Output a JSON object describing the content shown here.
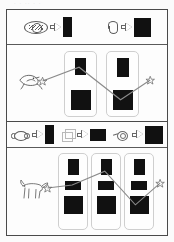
{
  "figure": {
    "scan_ghost_text": "· ·  ·· ·   ·",
    "panels": [
      {
        "id": "panel-a",
        "tag": "a",
        "legend": {
          "items": [
            {
              "source_icon": "plate-noodles-sketch-icon",
              "arrow_icon": "right-arrow-icon",
              "target_icon": "black-tall-rect",
              "target_w": 9,
              "target_h": 20
            },
            {
              "source_icon": "curved-worm-sketch-icon",
              "arrow_icon": "right-arrow-icon",
              "target_icon": "black-square",
              "target_w": 17,
              "target_h": 19
            }
          ]
        },
        "plot": {
          "animal_icon": "bird-sketch-icon",
          "start_marker": "star-marker",
          "end_marker": "star-marker",
          "cards": [
            {
              "boxes": [
                {
                  "w": 11,
                  "h": 17
                },
                {
                  "w": 20,
                  "h": 20
                }
              ]
            },
            {
              "boxes": [
                {
                  "w": 12,
                  "h": 19
                },
                {
                  "w": 20,
                  "h": 20
                }
              ]
            }
          ]
        }
      },
      {
        "id": "panel-b",
        "tag": "b",
        "legend": {
          "items": [
            {
              "source_icon": "peanut-oval-sketch-icon",
              "arrow_icon": "right-arrow-icon",
              "target_icon": "black-tall-rect",
              "target_w": 9,
              "target_h": 19
            },
            {
              "source_icon": "cube-outline-sketch-icon",
              "arrow_icon": "right-arrow-icon",
              "target_icon": "black-wide-rect",
              "target_w": 16,
              "target_h": 12
            },
            {
              "source_icon": "ring-tail-sketch-icon",
              "arrow_icon": "right-arrow-icon",
              "target_icon": "black-square",
              "target_w": 18,
              "target_h": 18
            }
          ]
        },
        "plot": {
          "animal_icon": "dog-sketch-icon",
          "start_marker": "star-marker",
          "end_marker": "star-marker",
          "cards": [
            {
              "boxes": [
                {
                  "w": 11,
                  "h": 16
                },
                {
                  "w": 16,
                  "h": 9
                },
                {
                  "w": 19,
                  "h": 18
                }
              ]
            },
            {
              "boxes": [
                {
                  "w": 11,
                  "h": 16
                },
                {
                  "w": 16,
                  "h": 9
                },
                {
                  "w": 19,
                  "h": 18
                }
              ]
            },
            {
              "boxes": [
                {
                  "w": 11,
                  "h": 16
                },
                {
                  "w": 16,
                  "h": 9
                },
                {
                  "w": 19,
                  "h": 18
                }
              ]
            }
          ]
        }
      }
    ],
    "colors": {
      "box_fill": "#111111",
      "frame": "#4a4a4a",
      "card_border": "#cfcfcf",
      "connector": "#808080",
      "sketch_stroke": "#5b5b5b",
      "background": "#fdfdfd"
    }
  }
}
